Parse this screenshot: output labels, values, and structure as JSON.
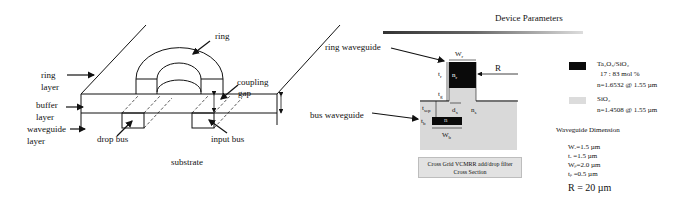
{
  "left_diagram": {
    "labels": {
      "ring": "ring",
      "ring_layer_1": "ring",
      "ring_layer_2": "layer",
      "buffer_layer_1": "buffer",
      "buffer_layer_2": "layer",
      "waveguide_layer_1": "waveguide",
      "waveguide_layer_2": "layer",
      "coupling_gap_1": "coupling",
      "coupling_gap_2": "gap",
      "drop_bus": "drop bus",
      "input_bus": "input bus",
      "substrate": "substrate"
    }
  },
  "cross_section": {
    "labels": {
      "ring_waveguide": "ring waveguide",
      "bus_waveguide": "bus waveguide",
      "Wr": "W",
      "Wr_sub": "r",
      "R": "R",
      "tr": "t",
      "tr_sub": "r",
      "nr": "n",
      "nr_sub": "r",
      "tg": "t",
      "tg_sub": "g",
      "tsep": "t",
      "tsep_sub": "sep",
      "dx": "d",
      "dx_sub": "x",
      "ns": "n",
      "ns_sub": "s",
      "n": "n",
      "tb": "t",
      "tb_sub": "b",
      "Wb": "W",
      "Wb_sub": "b"
    },
    "caption_line1": "Cross Grid VCMRR add/drop filter",
    "caption_line2": "Cross Section"
  },
  "parameters": {
    "title": "Device Parameters",
    "legend": [
      {
        "swatch_color": "#0a0a0a",
        "material": "Ta₂O₅/SiO₂",
        "composition": "17  :  83  mol %",
        "index": "n=1.6532 @ 1.55 µm"
      },
      {
        "swatch_color": "#dcdcdc",
        "material": "SiO₂",
        "index": "n=1.4508 @ 1.55 µm"
      }
    ],
    "dimension_title": "Waveguide Dimension",
    "dimensions": [
      "Wᵣ=1.5 µm",
      "tᵣ  =1.5 µm",
      "Wᵦ=2.0 µm",
      "tᵦ  =0.5 µm"
    ],
    "radius": "R = 20 µm"
  },
  "colors": {
    "core": "#0a0a0a",
    "cladding": "#d9d9d9",
    "line": "#111111"
  }
}
